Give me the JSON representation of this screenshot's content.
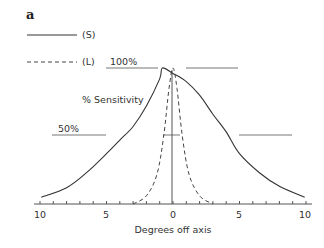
{
  "panel_label": "a",
  "legend": [
    {
      "label": "(S)",
      "style": "solid"
    },
    {
      "label": "(L)",
      "style": "dashed"
    }
  ],
  "annotations": {
    "pct100": "100%",
    "pct50": "50%",
    "ylabel": "% Sensitivity"
  },
  "xaxis": {
    "label": "Degrees off axis",
    "ticks": [
      "10",
      "5",
      "0",
      "5",
      "10"
    ]
  },
  "chart_data": {
    "type": "line",
    "title": "",
    "panel": "a",
    "xlabel": "Degrees off axis",
    "ylabel": "% Sensitivity",
    "x_tick_labels": [
      "10",
      "5",
      "0",
      "5",
      "10"
    ],
    "xlim": [
      -10,
      10
    ],
    "ylim": [
      0,
      100
    ],
    "grid": false,
    "legend_position": "top-left",
    "reference_lines": [
      {
        "label": "100%",
        "y": 100
      },
      {
        "label": "50%",
        "y": 50
      }
    ],
    "series": [
      {
        "name": "(S)",
        "style": "solid",
        "x": [
          -9.9,
          -8,
          -6.5,
          -5,
          -4,
          -3,
          -2,
          -1,
          -0.8,
          0,
          1,
          2,
          3,
          4,
          5,
          6.5,
          8,
          9.9
        ],
        "y": [
          5,
          12,
          23,
          37,
          47,
          57,
          72,
          92,
          100,
          96,
          90,
          80,
          66,
          53,
          37,
          23,
          13,
          5
        ]
      },
      {
        "name": "(L)",
        "style": "dashed",
        "x": [
          -3,
          -2,
          -1.2,
          -0.7,
          -0.3,
          0,
          0.3,
          0.7,
          1.2,
          2,
          3
        ],
        "y": [
          0,
          6,
          22,
          50,
          85,
          100,
          85,
          50,
          22,
          6,
          0
        ]
      }
    ],
    "annotations": [
      "100%",
      "50%",
      "% Sensitivity"
    ]
  }
}
